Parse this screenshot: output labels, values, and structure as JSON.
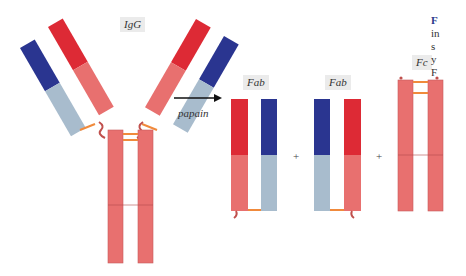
{
  "figure": {
    "labels": {
      "igg": "IgG",
      "fab_1": "Fab",
      "fab_2": "Fab",
      "fc": "Fc",
      "enzyme": "papain",
      "plus_1": "+",
      "plus_2": "+"
    },
    "caption_partial": {
      "lead": "F",
      "lines": [
        "in",
        "s",
        "y",
        "F"
      ]
    },
    "colors": {
      "heavy_variable": "#dd2a35",
      "heavy_constant": "#e8706f",
      "light_variable": "#2a3590",
      "light_constant": "#a8bccd",
      "disulfide": "#f08a3c",
      "label_bg": "#ebebeb",
      "caption_lead": "#2b3a8c"
    }
  }
}
